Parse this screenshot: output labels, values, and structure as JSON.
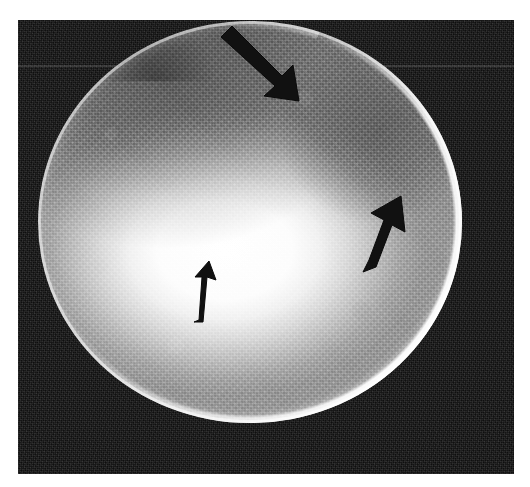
{
  "figure": {
    "type": "grayscale-medical-scan",
    "modality_appearance": "circular specimen with bright central hotspot and three black annotation arrows",
    "page_background": "#ffffff",
    "panel": {
      "x": 18,
      "y": 20,
      "width": 496,
      "height": 454,
      "background_color": "#101010",
      "description": "dark speckled imaging field"
    },
    "specimen": {
      "shape": "circle",
      "center_x": 250,
      "center_y": 222,
      "width": 424,
      "height": 402,
      "rim_color": "#ffffff",
      "body_color": "#a8a8a8",
      "hotspot_color": "#ffffff",
      "hotspot_center_x": 226,
      "hotspot_center_y": 250,
      "dark_region_upper_left_color": "#6e6e6e",
      "dark_region_upper_right_color": "#7a7a7a"
    },
    "annotations": {
      "arrow_color": "#111111",
      "arrows": [
        {
          "name": "arrow-top",
          "direction": "down-right",
          "tail_x": 222,
          "tail_y": 40,
          "tip_x": 282,
          "tip_y": 99,
          "points_at": "upper rim defect / capsular indentation"
        },
        {
          "name": "arrow-right",
          "direction": "up-right",
          "tail_x": 367,
          "tail_y": 270,
          "tip_x": 400,
          "tip_y": 200,
          "points_at": "darker heterogeneous region in upper-right quadrant"
        },
        {
          "name": "arrow-center",
          "direction": "up",
          "tail_x": 198,
          "tail_y": 321,
          "tip_x": 208,
          "tip_y": 262,
          "points_at": "bright central hyperechoic area"
        }
      ]
    }
  },
  "caption": {
    "text": ""
  }
}
